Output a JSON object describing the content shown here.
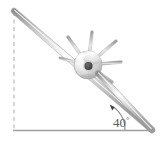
{
  "figure": {
    "angle_label": "40",
    "angle_symbol": "°",
    "angle_value": 40,
    "angle_units": "degrees",
    "elements": {
      "rod_name": "inclined-rod",
      "bead_name": "bead-sphere",
      "ground_name": "ground-line",
      "vertical_name": "vertical-dashed-line",
      "arc_name": "angle-arc-arrow",
      "hole_name": "bead-hole"
    },
    "colors": {
      "rod": "#c9c9c9",
      "rod_edge": "#9a9a9a",
      "bead_light": "#f2f2f2",
      "bead_mid": "#d6d6d6",
      "bead_shadow": "#a8a8a8",
      "hole": "#4a4a4a",
      "spoke": "#b5b5b5",
      "ground": "#9e9e9e",
      "dashed": "#bdbdbd",
      "text": "#5a5a5a",
      "background": "#ffffff"
    },
    "geometry": {
      "rod_start_x": 14,
      "rod_start_y": 11,
      "rod_end_x": 152,
      "rod_end_y": 130,
      "ground_y": 130,
      "ground_start_x": 14,
      "ground_end_x": 152,
      "vertical_x": 14,
      "vertical_top_y": 12,
      "bead_cx": 88,
      "bead_cy": 65,
      "bead_r": 14,
      "spoke_count": 5
    }
  }
}
